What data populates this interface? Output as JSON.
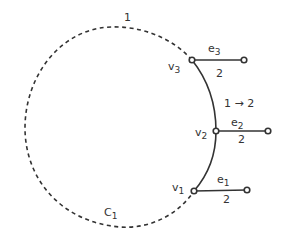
{
  "diagram": {
    "colors": {
      "stroke": "#333333",
      "background": "#ffffff"
    },
    "cycle": {
      "label": "C",
      "label_sub": "1",
      "dashed_arc_label": "1"
    },
    "vertices": [
      {
        "id": "v1",
        "name": "v",
        "sub": "1"
      },
      {
        "id": "v2",
        "name": "v",
        "sub": "2"
      },
      {
        "id": "v3",
        "name": "v",
        "sub": "3"
      }
    ],
    "edges": [
      {
        "id": "e1",
        "name": "e",
        "sub": "1",
        "weight": "2"
      },
      {
        "id": "e2",
        "name": "e",
        "sub": "2",
        "weight": "2"
      },
      {
        "id": "e3",
        "name": "e",
        "sub": "3",
        "weight": "2"
      }
    ],
    "solid_arc_label": "1 → 2"
  }
}
